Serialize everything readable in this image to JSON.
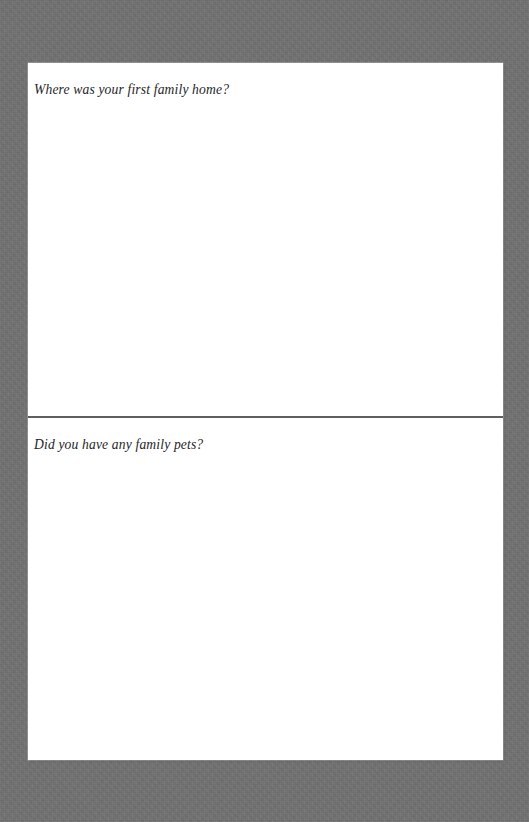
{
  "document": {
    "type": "memory-journal-page",
    "page_background_color": "#ffffff",
    "backdrop_color": "#707070",
    "text_color": "#26262a",
    "divider_color": "#5e5f61"
  },
  "sections": [
    {
      "id": "first-family-home",
      "question": "Where was your first family home?",
      "answer": "",
      "answer_placeholder": ""
    },
    {
      "id": "family-pets",
      "question": "Did you have any family pets?",
      "answer": "",
      "answer_placeholder": ""
    }
  ],
  "divider": {
    "label": "section-divider"
  }
}
